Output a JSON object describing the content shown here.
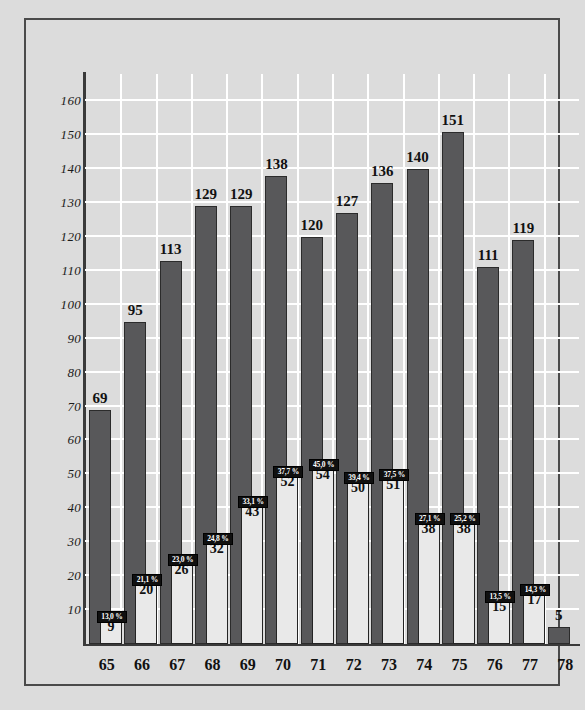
{
  "chart_data": {
    "type": "bar",
    "title": "",
    "subtitle": "",
    "xlabel": "",
    "ylabel": "",
    "categories": [
      "65",
      "66",
      "67",
      "68",
      "69",
      "70",
      "71",
      "72",
      "73",
      "74",
      "75",
      "76",
      "77",
      "78"
    ],
    "ylim": [
      0,
      168
    ],
    "yticks": [
      10,
      20,
      30,
      40,
      50,
      60,
      70,
      80,
      90,
      100,
      110,
      120,
      130,
      140,
      150,
      160
    ],
    "ytick_labels": [
      "10",
      "20",
      "30",
      "40",
      "50",
      "60",
      "70",
      "80",
      "90",
      "100",
      "110",
      "120",
      "130",
      "140",
      "150",
      "160"
    ],
    "grid": true,
    "legend": "none",
    "series": [
      {
        "name": "total",
        "color": "#58585a",
        "values": [
          69,
          95,
          113,
          129,
          129,
          138,
          120,
          127,
          136,
          140,
          151,
          111,
          119,
          5
        ],
        "labels": [
          "69",
          "95",
          "113",
          "129",
          "129",
          "138",
          "120",
          "127",
          "136",
          "140",
          "151",
          "111",
          "119",
          "5"
        ]
      },
      {
        "name": "subset",
        "color": "#e9e9e9",
        "values": [
          9,
          20,
          26,
          32,
          43,
          52,
          54,
          50,
          51,
          38,
          38,
          15,
          17,
          null
        ],
        "labels": [
          "9",
          "20",
          "26",
          "32",
          "43",
          "52",
          "54",
          "50",
          "51",
          "38",
          "38",
          "15",
          "17",
          null
        ],
        "percent_labels": [
          "13,0 %",
          "21,1 %",
          "23,0 %",
          "24,8 %",
          "33,1 %",
          "37,7 %",
          "45,0 %",
          "39,4 %",
          "37,5 %",
          "27,1 %",
          "25,2 %",
          "13,5 %",
          "14,3 %",
          null
        ]
      }
    ]
  },
  "style": {
    "background": "#dcdcdc",
    "grid_color": "#ffffff",
    "axis_color": "#3a3a3a",
    "frame_color": "#4a4a4a",
    "badge_bg": "#101010",
    "badge_fg": "#ffffff"
  }
}
